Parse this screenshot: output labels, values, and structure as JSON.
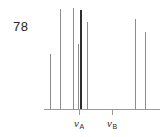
{
  "figure": {
    "number": "78",
    "kind": "nmr-stick-spectrum",
    "line_color": "#8c8c8c",
    "bold_line_color": "#2e2e2e",
    "axis_color": "#9a9a9a",
    "background": "#ffffff"
  },
  "axis": {
    "baseline_y": 109,
    "baseline_x_start": 44,
    "baseline_x_end": 160,
    "ticks": [
      {
        "name": "nu-A",
        "x": 79,
        "label_main": "ν",
        "label_sub": "A"
      },
      {
        "name": "nu-B",
        "x": 112,
        "label_main": "ν",
        "label_sub": "B"
      }
    ]
  },
  "chart_data": {
    "type": "bar",
    "title": "",
    "xlabel": "",
    "ylabel": "",
    "grid": false,
    "legend": null,
    "categories": [
      "1",
      "2",
      "3",
      "4",
      "5",
      "6",
      "7",
      "8"
    ],
    "x": [
      50,
      60,
      73,
      78,
      80,
      87,
      135,
      145
    ],
    "values": [
      54,
      99,
      100,
      64,
      98,
      86,
      89,
      76
    ],
    "ylim": [
      0,
      100
    ],
    "weights": [
      "normal",
      "normal",
      "normal",
      "normal",
      "bold",
      "normal",
      "normal",
      "normal"
    ],
    "annotations": [
      "ν_A",
      "ν_B"
    ]
  }
}
